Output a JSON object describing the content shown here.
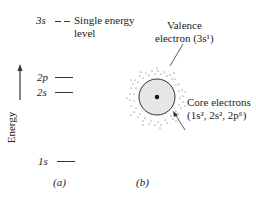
{
  "panel_a": {
    "caption": "(a)",
    "axis_label": "Energy",
    "levels": [
      {
        "name": "3s",
        "note_line1": "Single energy",
        "note_line2": "level"
      },
      {
        "name": "2p"
      },
      {
        "name": "2s"
      },
      {
        "name": "1s"
      }
    ]
  },
  "panel_b": {
    "caption": "(b)",
    "valence_label_line1": "Valence",
    "valence_label_line2": "electron (3s¹)",
    "core_label_line1": "Core electrons",
    "core_label_line2": "(1s², 2s², 2p⁶)"
  }
}
